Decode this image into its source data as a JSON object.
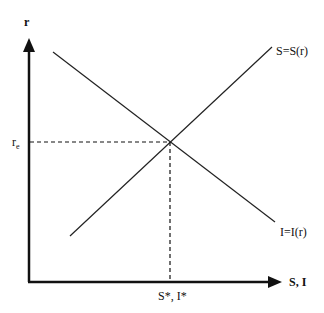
{
  "diagram": {
    "title": "",
    "y_axis": {
      "label": "r"
    },
    "x_axis": {
      "label": "S, I"
    },
    "equilibrium": {
      "r_label_main": "r",
      "r_label_sub": "e",
      "x_label": "S*, I*"
    },
    "curves": [
      {
        "name": "savings",
        "label": "S=S(r)",
        "slope": "upward"
      },
      {
        "name": "investment",
        "label": "I=I(r)",
        "slope": "downward"
      }
    ],
    "colors": {
      "line": "#111111",
      "background": "#ffffff"
    }
  }
}
